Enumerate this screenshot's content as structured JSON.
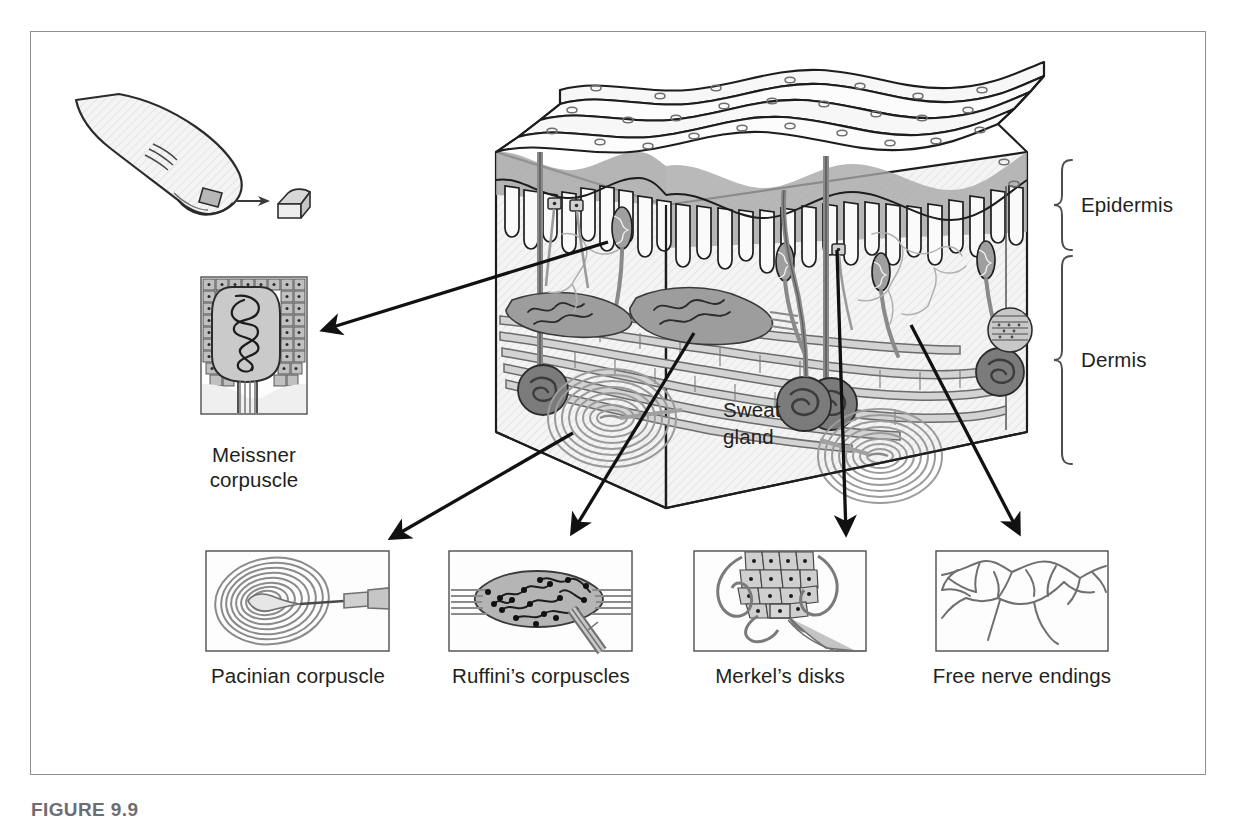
{
  "figure": {
    "caption": "FIGURE 9.9",
    "frame_color": "#8e8e93",
    "ink_color": "#231f20",
    "fill_light": "#f2f2f2",
    "fill_mid": "#c9c9c9",
    "fill_dark": "#9a9a9a"
  },
  "layers": {
    "epidermis_label": "Epidermis",
    "dermis_label": "Dermis"
  },
  "block_labels": {
    "sweat_gland_line1": "Sweat",
    "sweat_gland_line2": "gland"
  },
  "insets": [
    {
      "id": "meissner",
      "label_line1": "Meissner",
      "label_line2": "corpuscle",
      "icon": "meissner-corpuscle-icon"
    },
    {
      "id": "pacinian",
      "label_line1": "Pacinian corpuscle",
      "label_line2": "",
      "icon": "pacinian-corpuscle-icon"
    },
    {
      "id": "ruffini",
      "label_line1": "Ruffini’s corpuscles",
      "label_line2": "",
      "icon": "ruffini-corpuscle-icon"
    },
    {
      "id": "merkel",
      "label_line1": "Merkel’s disks",
      "label_line2": "",
      "icon": "merkel-disk-icon"
    },
    {
      "id": "free-nerve",
      "label_line1": "Free nerve endings",
      "label_line2": "",
      "icon": "free-nerve-ending-icon"
    }
  ],
  "finger": {
    "icon": "fingertip-icon",
    "sample_icon": "skin-sample-block-icon",
    "arrow_icon": "arrow-right-icon"
  }
}
